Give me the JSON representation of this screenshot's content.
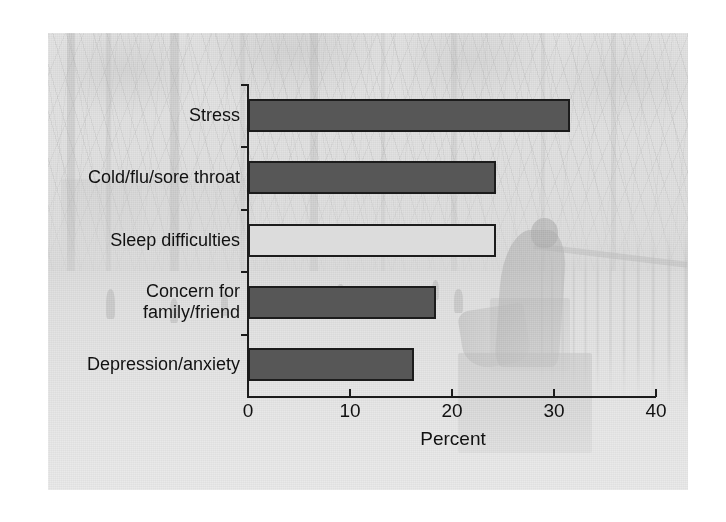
{
  "figure": {
    "background_image_description": "faded grayscale photograph of a tree-lined campus yard with a seated statue",
    "colors": {
      "bar_dark": "#575757",
      "bar_light": "#dcdcdc",
      "bar_outline": "#1c1c1c",
      "axis": "#1c1c1c",
      "text": "#111111",
      "page_background": "#ffffff"
    }
  },
  "chart_data": {
    "type": "bar",
    "orientation": "horizontal",
    "title": "",
    "subtitle": "",
    "xlabel": "Percent",
    "ylabel": "",
    "xlim": [
      0,
      40
    ],
    "ylim": null,
    "grid": false,
    "legend": null,
    "xticks": [
      "0",
      "10",
      "20",
      "30",
      "40"
    ],
    "xtick_values": [
      0,
      10,
      20,
      30,
      40
    ],
    "categories": [
      "Stress",
      "Cold/flu/sore throat",
      "Sleep difficulties",
      "Concern for family/friend",
      "Depression/anxiety"
    ],
    "category_lines": [
      [
        "Stress"
      ],
      [
        "Cold/flu/sore throat"
      ],
      [
        "Sleep difficulties"
      ],
      [
        "Concern for",
        "family/friend"
      ],
      [
        "Depression/anxiety"
      ]
    ],
    "values": [
      31.6,
      24.3,
      24.3,
      18.4,
      16.3
    ],
    "bar_styles": [
      "dark",
      "dark",
      "light",
      "dark",
      "dark"
    ],
    "annotations": []
  }
}
